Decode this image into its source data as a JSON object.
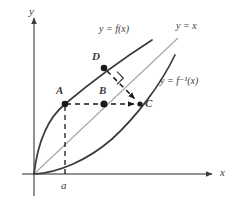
{
  "figure": {
    "background_color": "#ffffff",
    "width": 238,
    "height": 204
  },
  "colors": {
    "curve": "#3b3b3b",
    "identity_line": "#a9a9a9",
    "axis": "#6e6e6e",
    "dashed": "#3b3b3b",
    "point_fill": "#1a1a1a",
    "text": "#3b3b3b"
  },
  "axes": {
    "x_label": "x",
    "y_label": "y",
    "x_axis": {
      "y": 174,
      "x_start": 22,
      "x_end": 215
    },
    "y_axis": {
      "x": 34,
      "y_start": 14,
      "y_end": 196
    },
    "x_label_pos": {
      "x": 220,
      "y": 169
    },
    "y_label_pos": {
      "x": 29,
      "y": 6
    }
  },
  "ticks": [
    {
      "name": "a",
      "label": "a",
      "x": 65,
      "y": 180
    }
  ],
  "curves": [
    {
      "name": "f",
      "label": "y = f(x)",
      "label_pos": {
        "x": 99,
        "y": 28
      },
      "path": "M 34 174 C 38 140 48 118 65 104 C 90 83 124 58 152 40",
      "stroke": "#3b3b3b",
      "width": 1.6,
      "dashed": false
    },
    {
      "name": "f-inverse",
      "label": "y = f⁻¹(x)",
      "label_pos": {
        "x": 160,
        "y": 79
      },
      "path": "M 34 174 C 58 173 88 160 112 139 C 136 117 160 86 175 55",
      "stroke": "#3b3b3b",
      "width": 1.6,
      "dashed": false
    },
    {
      "name": "identity",
      "label": "y = x",
      "label_pos": {
        "x": 176,
        "y": 25
      },
      "path": "M 34 174 L 178 38",
      "stroke": "#a9a9a9",
      "width": 1.2,
      "dashed": false
    }
  ],
  "points": [
    {
      "name": "A",
      "label": "A",
      "x": 65,
      "y": 104,
      "label_pos": {
        "x": 56,
        "y": 87
      }
    },
    {
      "name": "B",
      "label": "B",
      "x": 104,
      "y": 104,
      "label_pos": {
        "x": 99,
        "y": 87
      }
    },
    {
      "name": "C",
      "label": "C",
      "x": 140,
      "y": 104,
      "label_pos": {
        "x": 145,
        "y": 99
      }
    },
    {
      "name": "D",
      "label": "D",
      "x": 104,
      "y": 68,
      "label_pos": {
        "x": 92,
        "y": 53
      }
    }
  ],
  "connectors": [
    {
      "name": "A-to-C-horizontal",
      "from": "A",
      "to": "C",
      "path": "M 66 104 L 137 104",
      "dashed": true,
      "arrow": true
    },
    {
      "name": "A-to-axis-vertical",
      "from": "A",
      "to": "a",
      "path": "M 65 105 L 65 174",
      "dashed": true,
      "arrow": false
    },
    {
      "name": "D-to-C-diagonal",
      "from": "D",
      "to": "C",
      "path": "M 107 71 L 137 101",
      "dashed": true,
      "arrow": true
    }
  ],
  "right_angle": {
    "name": "right-angle-marker",
    "center": {
      "x": 117,
      "y": 78
    },
    "size": 9,
    "rotation_deg": 45
  }
}
